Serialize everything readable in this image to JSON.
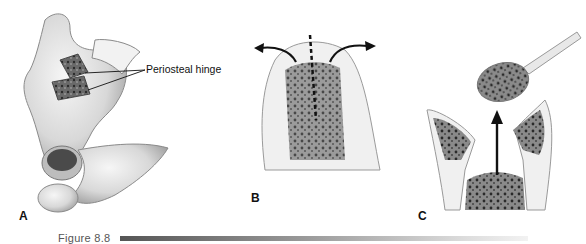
{
  "figure": {
    "caption": "Figure 8.8",
    "panels": [
      {
        "id": "A",
        "label": "A",
        "description": "Pelvic bone with cortical window opened on periosteal hinge",
        "callout": "Periosteal hinge"
      },
      {
        "id": "B",
        "label": "B",
        "description": "Bone cross-section with midline split and outward arrows"
      },
      {
        "id": "C",
        "label": "C",
        "description": "Curette removing cancellous bone graft, upward arrow"
      }
    ]
  },
  "colors": {
    "ink": "#111111",
    "bone_light": "#e6e6e6",
    "bone_shade": "#9a9a9a",
    "cancellous": "#555555"
  }
}
